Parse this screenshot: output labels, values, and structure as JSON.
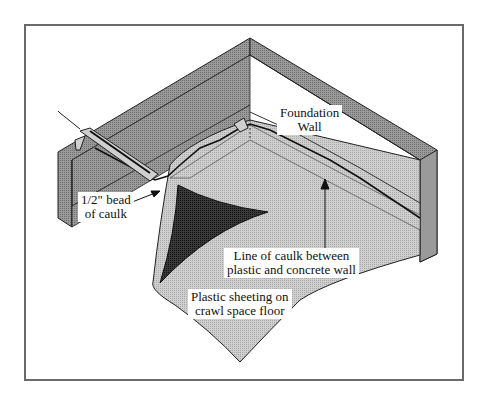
{
  "diagram": {
    "labels": {
      "foundation_wall": [
        "Foundation",
        "Wall"
      ],
      "bead_of_caulk": [
        "1/2\" bead",
        "of caulk"
      ],
      "line_of_caulk": [
        "Line of caulk between",
        "plastic and concrete wall"
      ],
      "plastic_sheeting": [
        "Plastic sheeting on",
        "crawl space floor"
      ]
    },
    "colors": {
      "wall_gray": "#8c8c8c",
      "wall_top": "#a8a8a8",
      "sheet_light": "#c8c8c8",
      "sheet_dark": "#2a2a2a",
      "frame": "#6a6a6a"
    }
  }
}
